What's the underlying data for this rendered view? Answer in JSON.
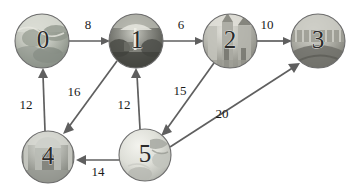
{
  "diagram": {
    "width": 352,
    "height": 194,
    "background": "#ffffff",
    "edge_color": "#5f5f5f",
    "label_color": "#1a1a1a",
    "node_outline_color": "#6d6d6d"
  },
  "nodes": [
    {
      "id": "0",
      "label": "0",
      "name": "node-0",
      "cx": 42,
      "cy": 41,
      "r": 27,
      "image": "globe-world-map-photo",
      "palette": [
        "#cfcfc8",
        "#9ea39a",
        "#b9bdb4",
        "#7f857d",
        "#e3e3dd"
      ]
    },
    {
      "id": "1",
      "label": "1",
      "name": "node-1",
      "cx": 136,
      "cy": 41,
      "r": 27,
      "image": "market-stall-umbrella-photo",
      "palette": [
        "#8d8d86",
        "#5d5e58",
        "#b0b1a8",
        "#3f403b",
        "#d2d2cb"
      ]
    },
    {
      "id": "2",
      "label": "2",
      "name": "node-2",
      "cx": 230,
      "cy": 41,
      "r": 27,
      "image": "cathedral-building-photo",
      "palette": [
        "#c9c9c2",
        "#a2a29a",
        "#8b8b83",
        "#dcdcd5",
        "#6f6f68"
      ]
    },
    {
      "id": "3",
      "label": "3",
      "name": "node-3",
      "cx": 318,
      "cy": 41,
      "r": 27,
      "image": "bridge-over-water-photo",
      "palette": [
        "#b6b6ae",
        "#8e8e86",
        "#d7d7d0",
        "#5a5a54",
        "#cbcbc4"
      ]
    },
    {
      "id": "4",
      "label": "4",
      "name": "node-4",
      "cx": 48,
      "cy": 157,
      "r": 26,
      "image": "taj-mahal-photo",
      "palette": [
        "#b0b2ab",
        "#858780",
        "#cdcfc8",
        "#63655f",
        "#e0e1da"
      ]
    },
    {
      "id": "5",
      "label": "5",
      "name": "node-5",
      "cx": 145,
      "cy": 155,
      "r": 26,
      "image": "globe-world-map-photo",
      "palette": [
        "#e2e2dc",
        "#c4c6bf",
        "#a9aba4",
        "#8d8f88",
        "#f0f0ea"
      ]
    }
  ],
  "edges": [
    {
      "name": "edge-0-to-1",
      "from": "0",
      "to": "1",
      "weight": "8",
      "x1": 69,
      "y1": 41,
      "x2": 109,
      "y2": 41,
      "lx": 88,
      "ly": 26
    },
    {
      "name": "edge-1-to-2",
      "from": "1",
      "to": "2",
      "weight": "6",
      "x1": 163,
      "y1": 41,
      "x2": 203,
      "y2": 41,
      "lx": 181,
      "ly": 26
    },
    {
      "name": "edge-2-to-3",
      "from": "2",
      "to": "3",
      "weight": "10",
      "x1": 257,
      "y1": 41,
      "x2": 291,
      "y2": 41,
      "lx": 267,
      "ly": 26
    },
    {
      "name": "edge-4-to-0",
      "from": "4",
      "to": "0",
      "weight": "12",
      "x1": 45,
      "y1": 131,
      "x2": 43,
      "y2": 69,
      "lx": 26,
      "ly": 106
    },
    {
      "name": "edge-1-to-4",
      "from": "1",
      "to": "4",
      "weight": "16",
      "x1": 117,
      "y1": 61,
      "x2": 63,
      "y2": 134,
      "lx": 74,
      "ly": 93
    },
    {
      "name": "edge-5-to-1",
      "from": "5",
      "to": "1",
      "weight": "12",
      "x1": 140,
      "y1": 129,
      "x2": 136,
      "y2": 69,
      "lx": 124,
      "ly": 106
    },
    {
      "name": "edge-2-to-5",
      "from": "2",
      "to": "5",
      "weight": "15",
      "x1": 214,
      "y1": 63,
      "x2": 161,
      "y2": 136,
      "lx": 180,
      "ly": 92
    },
    {
      "name": "edge-5-to-4",
      "from": "5",
      "to": "4",
      "weight": "14",
      "x1": 119,
      "y1": 160,
      "x2": 77,
      "y2": 160,
      "lx": 98,
      "ly": 173
    },
    {
      "name": "edge-5-to-3",
      "from": "5",
      "to": "3",
      "weight": "20",
      "x1": 170,
      "y1": 147,
      "x2": 300,
      "y2": 63,
      "lx": 222,
      "ly": 115
    }
  ]
}
